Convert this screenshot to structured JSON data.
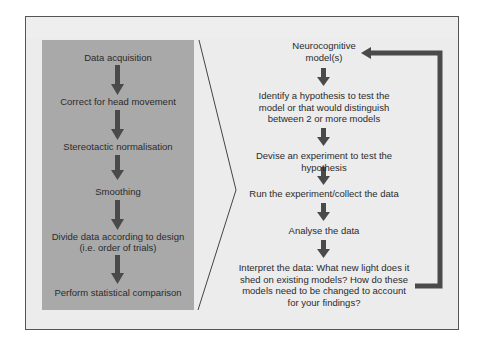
{
  "diagram": {
    "type": "flowchart",
    "left_panel": {
      "steps": [
        {
          "label": "Data acquisition"
        },
        {
          "label": "Correct for head movement"
        },
        {
          "label": "Stereotactic normalisation"
        },
        {
          "label": "Smoothing"
        },
        {
          "label": "Divide data according to design",
          "sublabel": "(i.e. order of trials)"
        },
        {
          "label": "Perform statistical comparison"
        }
      ]
    },
    "right_panel": {
      "steps": [
        {
          "line1": "Neurocognitive",
          "line2": "model(s)"
        },
        {
          "line1": "Identify a hypothesis to test the",
          "line2": "model or that would distinguish",
          "line3": "between 2 or more models"
        },
        {
          "line1": "Devise an experiment to test the hypothesis"
        },
        {
          "line1": "Run the experiment/collect the data"
        },
        {
          "line1": "Analyse the data"
        },
        {
          "line1": "Interpret the data: What new light does it",
          "line2": "shed on existing models? How do these",
          "line3": "models need to be changed to account",
          "line4": "for your findings?"
        }
      ],
      "feedback_loop": {
        "from": "Interpret the data",
        "to": "Neurocognitive model(s)"
      }
    },
    "colors": {
      "frame_bg": "#ececec",
      "panel_bg": "#a9a9a9",
      "arrow": "#4a4a4a",
      "border": "#555555"
    }
  }
}
